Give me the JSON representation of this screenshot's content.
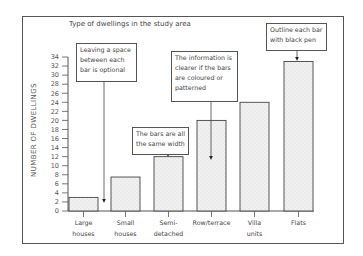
{
  "chart_data": {
    "type": "bar",
    "title": "Type of dwellings in the study area",
    "xlabel": "",
    "ylabel": "NUMBER OF DWELLINGS",
    "categories": [
      "Large houses",
      "Small houses",
      "Semi-detached",
      "Row/terrace",
      "Villa units",
      "Flats"
    ],
    "category_labels": [
      "Large\nhouses",
      "Small\nhouses",
      "Semi-\ndetached",
      "Row/terrace",
      "Villa\nunits",
      "Flats"
    ],
    "values": [
      3,
      7.5,
      12,
      20,
      24,
      33
    ],
    "ylim": [
      0,
      34
    ],
    "yticks": [
      0,
      2,
      4,
      6,
      8,
      10,
      12,
      14,
      16,
      18,
      20,
      22,
      24,
      26,
      28,
      30,
      32,
      34
    ],
    "grid": false,
    "legend": null,
    "bar_fill": "stippled light grey",
    "annotations": [
      "Leaving a space between each bar is optional",
      "The bars are all the same width",
      "The information is clearer if the bars are coloured or patterned",
      "Outline each bar with black pen"
    ]
  },
  "callouts": {
    "spacing": "Leaving a space between each bar is optional",
    "width": "The bars are all the same width",
    "pattern": "The information is clearer if the bars are coloured or patterned",
    "outline": "Outline each bar with black pen"
  }
}
